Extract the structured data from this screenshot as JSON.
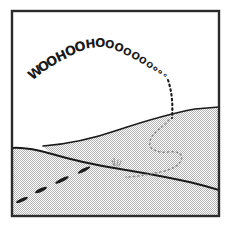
{
  "panel": {
    "title": "Comic panel: sledding down a snowy hill",
    "border_color": "#2b2b2b",
    "sky_color": "#ffffff",
    "ground_color": "#c9c9c9",
    "ink_color": "#1a1a1a",
    "faint_ink_color": "#8a8a8a",
    "width": 231,
    "height": 227
  },
  "shout": {
    "full_text": "WOOHOOHOOOOOOOooo",
    "letters": [
      {
        "ch": "W",
        "x": 38,
        "y": 76,
        "size": 13,
        "rot": -38
      },
      {
        "ch": "O",
        "x": 46,
        "y": 70,
        "size": 13,
        "rot": -34
      },
      {
        "ch": "O",
        "x": 54,
        "y": 65,
        "size": 13,
        "rot": -30
      },
      {
        "ch": "H",
        "x": 63,
        "y": 60,
        "size": 13,
        "rot": -24
      },
      {
        "ch": "O",
        "x": 72,
        "y": 55,
        "size": 13,
        "rot": -19
      },
      {
        "ch": "O",
        "x": 81,
        "y": 51,
        "size": 13,
        "rot": -14
      },
      {
        "ch": "H",
        "x": 91,
        "y": 48,
        "size": 12,
        "rot": -7
      },
      {
        "ch": "O",
        "x": 100,
        "y": 47,
        "size": 12,
        "rot": 2
      },
      {
        "ch": "O",
        "x": 109,
        "y": 48,
        "size": 11,
        "rot": 10
      },
      {
        "ch": "O",
        "x": 118,
        "y": 51,
        "size": 11,
        "rot": 17
      },
      {
        "ch": "O",
        "x": 126,
        "y": 55,
        "size": 10,
        "rot": 24
      },
      {
        "ch": "O",
        "x": 134,
        "y": 59,
        "size": 10,
        "rot": 30
      },
      {
        "ch": "O",
        "x": 141,
        "y": 63,
        "size": 9,
        "rot": 34
      },
      {
        "ch": "O",
        "x": 148,
        "y": 67,
        "size": 8,
        "rot": 38
      },
      {
        "ch": "o",
        "x": 154,
        "y": 70,
        "size": 7,
        "rot": 42
      },
      {
        "ch": "o",
        "x": 159,
        "y": 73,
        "size": 6,
        "rot": 46
      },
      {
        "ch": "o",
        "x": 164,
        "y": 76,
        "size": 5,
        "rot": 50
      }
    ]
  },
  "scene": {
    "upper_ridge": {
      "name": "upper-hill-ridge",
      "path": "M 43,146 C 70,144 95,138 118,130 C 142,122 168,114 195,109 L 219,107",
      "stroke_width": 1.7
    },
    "lower_ridge": {
      "name": "lower-hill-ridge",
      "path": "M 12,148 C 26,147 38,150 52,154 C 72,160 95,165 120,169 C 150,174 180,179 205,186 L 219,190",
      "stroke_width": 2.0
    },
    "ground_fill_upper": "M 43,146 C 70,144 95,138 118,130 C 142,122 168,114 195,109 L 219,107 L 219,216 L 12,216 L 12,148 C 26,147 38,150 52,154 Z",
    "air_descent_trail": {
      "name": "sled-air-descent-trail",
      "path": "M 168,80 C 172,92 173,104 172,118",
      "dash": "1.6 3.2",
      "stroke_width": 2.1
    },
    "hill_track_trail": {
      "name": "sled-hill-track-trail",
      "path": "M 169,120 C 162,128 152,133 150,141 C 148,150 158,153 168,152 C 178,151 184,154 181,161 C 177,169 162,172 150,174 C 140,176 132,177 126,177",
      "dash": "1.4 3.0",
      "stroke_width": 1.5
    },
    "foreground_tracks": [
      {
        "name": "track-dash-1",
        "x": 22,
        "y": 200,
        "w": 13,
        "h": 3.4,
        "rot": -24
      },
      {
        "name": "track-dash-2",
        "x": 41,
        "y": 190,
        "w": 13,
        "h": 3.6,
        "rot": -25
      },
      {
        "name": "track-dash-3",
        "x": 62,
        "y": 180,
        "w": 15,
        "h": 3.6,
        "rot": -26
      },
      {
        "name": "track-dash-4",
        "x": 84,
        "y": 170,
        "w": 14,
        "h": 3.4,
        "rot": -27
      }
    ],
    "grass_tuft": {
      "name": "grass-tuft",
      "x": 114,
      "y": 166,
      "blades": [
        "M 0,0 L -2,-6",
        "M 1,0 L 0,-8",
        "M 3,0 L 4,-6",
        "M 5,0 L 7,-5"
      ]
    }
  }
}
